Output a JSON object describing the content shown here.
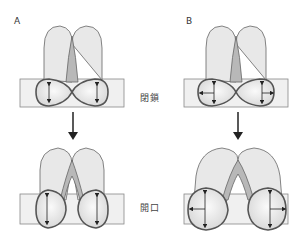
{
  "panels": [
    {
      "id": "A",
      "label": "A"
    },
    {
      "id": "B",
      "label": "B"
    }
  ],
  "states": {
    "closed": "閉鎖",
    "open": "開口"
  },
  "colors": {
    "outline": "#555555",
    "fill_light": "#e4e4e4",
    "fill_mid": "#b8b8b8",
    "band": "#f0f0f0",
    "arrow": "#222222"
  }
}
